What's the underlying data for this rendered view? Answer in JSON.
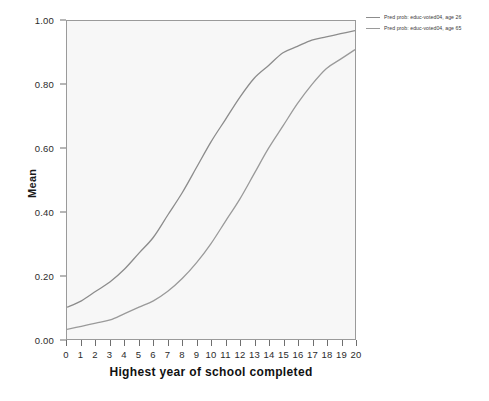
{
  "chart_data": {
    "type": "line",
    "title": "",
    "xlabel": "Highest year of school completed",
    "ylabel": "Mean",
    "xlim": [
      0,
      20
    ],
    "ylim": [
      0.0,
      1.0
    ],
    "grid": false,
    "legend_position": "top-right",
    "x_tick_labels": [
      "0",
      "1",
      "2",
      "3",
      "4",
      "5",
      "6",
      "7",
      "8",
      "9",
      "10",
      "11",
      "12",
      "13",
      "14",
      "15",
      "16",
      "17",
      "18",
      "19",
      "20"
    ],
    "y_tick_labels": [
      "0.00",
      "0.20",
      "0.40",
      "0.60",
      "0.80",
      "1.00"
    ],
    "y_tick_values": [
      0.0,
      0.2,
      0.4,
      0.6,
      0.8,
      1.0
    ],
    "x": [
      0,
      1,
      2,
      3,
      4,
      5,
      6,
      7,
      8,
      9,
      10,
      11,
      12,
      13,
      14,
      15,
      16,
      17,
      18,
      19,
      20
    ],
    "series": [
      {
        "name": "Pred prob: educ-voted04, age 26",
        "color": "#8c8c8c",
        "values": [
          0.1,
          0.12,
          0.15,
          0.18,
          0.22,
          0.27,
          0.32,
          0.39,
          0.46,
          0.54,
          0.62,
          0.69,
          0.76,
          0.82,
          0.86,
          0.9,
          0.92,
          0.94,
          0.95,
          0.96,
          0.97
        ]
      },
      {
        "name": "Pred prob: educ-voted04, age 65",
        "color": "#9a9a9a",
        "values": [
          0.03,
          0.04,
          0.05,
          0.06,
          0.08,
          0.1,
          0.12,
          0.15,
          0.19,
          0.24,
          0.3,
          0.37,
          0.44,
          0.52,
          0.6,
          0.67,
          0.74,
          0.8,
          0.85,
          0.88,
          0.91
        ]
      }
    ],
    "legend": [
      "Pred prob: educ-voted04, age 26",
      "Pred prob: educ-voted04, age 65"
    ],
    "colors": {
      "plot_background": "#f7f7f7",
      "frame": "#9a9a9a",
      "line_1": "#8c8c8c",
      "line_2": "#9a9a9a",
      "text": "#1a1a1a"
    }
  }
}
